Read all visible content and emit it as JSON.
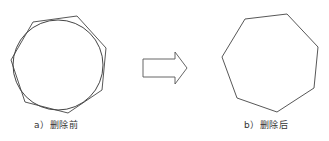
{
  "panels": [
    {
      "id": "a",
      "caption": "a）删除前",
      "shapes": {
        "circle": {
          "cx": 58,
          "cy": 65,
          "r": 45
        },
        "polygon": [
          [
            33,
            22
          ],
          [
            77,
            16
          ],
          [
            106,
            48
          ],
          [
            102,
            90
          ],
          [
            68,
            113
          ],
          [
            25,
            102
          ],
          [
            11,
            60
          ]
        ]
      }
    },
    {
      "id": "b",
      "caption": "b）删除后",
      "shapes": {
        "polygon": [
          [
            245,
            19
          ],
          [
            287,
            14
          ],
          [
            318,
            47
          ],
          [
            314,
            88
          ],
          [
            277,
            112
          ],
          [
            237,
            98
          ],
          [
            222,
            57
          ]
        ]
      }
    }
  ],
  "arrow": {
    "direction": "right",
    "points": [
      [
        143,
        59
      ],
      [
        175,
        59
      ],
      [
        175,
        52
      ],
      [
        187,
        68
      ],
      [
        175,
        84
      ],
      [
        175,
        77
      ],
      [
        143,
        77
      ]
    ]
  },
  "colors": {
    "stroke": "#444444",
    "text": "#333333"
  }
}
